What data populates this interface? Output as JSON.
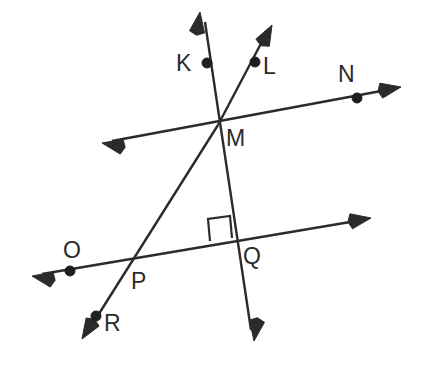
{
  "figure": {
    "type": "geometry-diagram",
    "width": 425,
    "height": 370,
    "background_color": "#ffffff",
    "stroke_color": "#2b2b2b",
    "point_color": "#1e1e1e"
  },
  "labels": {
    "K": "K",
    "L": "L",
    "N": "N",
    "M": "M",
    "O": "O",
    "P": "P",
    "Q": "Q",
    "R": "R"
  },
  "label_positions": {
    "K": {
      "x": 176,
      "y": 52
    },
    "L": {
      "x": 263,
      "y": 55
    },
    "N": {
      "x": 338,
      "y": 63
    },
    "M": {
      "x": 226,
      "y": 127
    },
    "O": {
      "x": 63,
      "y": 239
    },
    "P": {
      "x": 131,
      "y": 270
    },
    "Q": {
      "x": 243,
      "y": 245
    },
    "R": {
      "x": 104,
      "y": 312
    }
  },
  "points": [
    {
      "name": "K",
      "x": 207,
      "y": 63,
      "r": 5.0
    },
    {
      "name": "L",
      "x": 255,
      "y": 62,
      "r": 5.0
    },
    {
      "name": "N",
      "x": 357,
      "y": 98,
      "r": 5.0
    },
    {
      "name": "M",
      "x": 218,
      "y": 125,
      "r": 0
    },
    {
      "name": "O",
      "x": 70,
      "y": 271,
      "r": 5.0
    },
    {
      "name": "P",
      "x": 134,
      "y": 262,
      "r": 0
    },
    {
      "name": "Q",
      "x": 238,
      "y": 243,
      "r": 0
    },
    {
      "name": "R",
      "x": 96,
      "y": 316,
      "r": 5.0
    }
  ],
  "lines": [
    {
      "name": "line-K-M-Q-down",
      "description": "double-headed line through K, M, Q",
      "from": {
        "x": 205,
        "y": 22
      },
      "to": {
        "x": 251,
        "y": 330
      },
      "arrow_start": true,
      "arrow_end": true
    },
    {
      "name": "ray-M-L",
      "description": "ray from M through L",
      "from": {
        "x": 218,
        "y": 125
      },
      "to": {
        "x": 266,
        "y": 34
      },
      "arrow_start": false,
      "arrow_end": true
    },
    {
      "name": "line-M-N",
      "description": "double-headed line through M and N",
      "from": {
        "x": 112,
        "y": 141
      },
      "to": {
        "x": 392,
        "y": 89
      },
      "arrow_start": true,
      "arrow_end": true
    },
    {
      "name": "line-O-P-Q",
      "description": "double-headed line through O, P, Q",
      "from": {
        "x": 42,
        "y": 274
      },
      "to": {
        "x": 362,
        "y": 220
      },
      "arrow_start": true,
      "arrow_end": true
    },
    {
      "name": "line-M-P-R",
      "description": "line from M through P and R",
      "from": {
        "x": 218,
        "y": 125
      },
      "to": {
        "x": 90,
        "y": 328
      },
      "arrow_start": false,
      "arrow_end": true
    }
  ],
  "angle_marks": [
    {
      "name": "right-angle-at-Q",
      "vertex": "Q",
      "type": "right-angle-square",
      "path": "M 210,241 L 208,219 L 230,216 L 232,238"
    }
  ],
  "arrowheads": [
    {
      "name": "arrow-K-ray-up",
      "tip_x": 200,
      "tip_y": 12,
      "angle_deg": -81.5
    },
    {
      "name": "arrow-M-down",
      "tip_x": 254,
      "tip_y": 341,
      "angle_deg": 98.5
    },
    {
      "name": "arrow-L-ray",
      "tip_x": 272,
      "tip_y": 25,
      "angle_deg": -62.0
    },
    {
      "name": "arrow-MN-left",
      "tip_x": 102,
      "tip_y": 143,
      "angle_deg": 190.5
    },
    {
      "name": "arrow-MN-right",
      "tip_x": 401,
      "tip_y": 87,
      "angle_deg": -10.5
    },
    {
      "name": "arrow-OQ-left",
      "tip_x": 32,
      "tip_y": 276,
      "angle_deg": 190.5
    },
    {
      "name": "arrow-OQ-right",
      "tip_x": 371,
      "tip_y": 218,
      "angle_deg": -9.5
    },
    {
      "name": "arrow-MR-down",
      "tip_x": 82,
      "tip_y": 339,
      "angle_deg": 122.0
    }
  ]
}
